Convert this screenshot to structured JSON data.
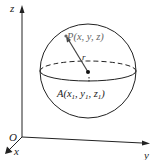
{
  "diagram": {
    "axes": {
      "origin_label": "O",
      "x_label": "x",
      "y_label": "y",
      "z_label": "z"
    },
    "sphere": {
      "center_label": "A(x₁, y₁, z₁)",
      "center_label_parts": {
        "A": "A(x",
        "s1": "1",
        "c1": ", y",
        "s2": "1",
        "c2": ", z",
        "s3": "1",
        "end": ")"
      },
      "point_label": "P(x, y, z)",
      "radius_label": "r"
    },
    "colors": {
      "line": "#222222",
      "point_label": "#666666",
      "background": "#ffffff"
    }
  }
}
